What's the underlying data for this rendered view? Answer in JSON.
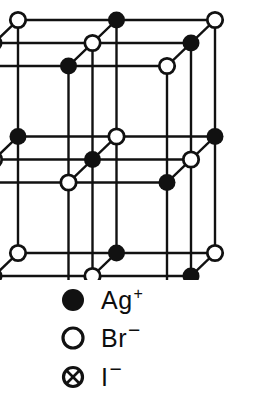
{
  "figure": {
    "alt": "Three-dimensional cubic lattice diagram of a silver bromide crystal with two iodide substitution sites",
    "background_color": "#ffffff",
    "ink_color": "#111111"
  },
  "lattice": {
    "type": "rock-salt cubic lattice",
    "grid": {
      "nx": 3,
      "ny": 3,
      "nz": 3
    },
    "projection": "oblique",
    "origin": {
      "x": 18,
      "y": 253
    },
    "step_x": 98.5,
    "step_y": -116.5,
    "depth_dx": -24,
    "depth_dy": 23,
    "bond_line_width": 2.4,
    "node_radius": 8.5,
    "nodes": [
      {
        "i": 0,
        "j": 0,
        "k": 0,
        "species": "Br",
        "x": 18,
        "y": 253
      },
      {
        "i": 1,
        "j": 0,
        "k": 0,
        "species": "Ag",
        "x": 117,
        "y": 253
      },
      {
        "i": 2,
        "j": 0,
        "k": 0,
        "species": "Br",
        "x": 215,
        "y": 253
      },
      {
        "i": 0,
        "j": 1,
        "k": 0,
        "species": "Ag",
        "x": 18,
        "y": 137
      },
      {
        "i": 1,
        "j": 1,
        "k": 0,
        "species": "Br",
        "x": 117,
        "y": 137
      },
      {
        "i": 2,
        "j": 1,
        "k": 0,
        "species": "Ag",
        "x": 215,
        "y": 137
      },
      {
        "i": 0,
        "j": 2,
        "k": 0,
        "species": "Br",
        "x": 18,
        "y": 20
      },
      {
        "i": 1,
        "j": 2,
        "k": 0,
        "species": "Ag",
        "x": 117,
        "y": 20
      },
      {
        "i": 2,
        "j": 2,
        "k": 0,
        "species": "Br",
        "x": 215,
        "y": 20
      }
    ],
    "iodide_sites": [
      {
        "label": "I-site-upper",
        "x": 163,
        "y": 115
      },
      {
        "label": "I-site-lower",
        "x": 258,
        "y": 205
      }
    ]
  },
  "legend": {
    "title": "Ion key",
    "items": [
      {
        "id": "ag",
        "marker": "filled-circle-icon",
        "symbol": "Ag",
        "charge": "+",
        "name": "silver-cation"
      },
      {
        "id": "br",
        "marker": "open-circle-icon",
        "symbol": "Br",
        "charge": "−",
        "name": "bromide-anion"
      },
      {
        "id": "i",
        "marker": "crossed-circle-icon",
        "symbol": "I",
        "charge": "−",
        "name": "iodide-anion"
      }
    ]
  }
}
